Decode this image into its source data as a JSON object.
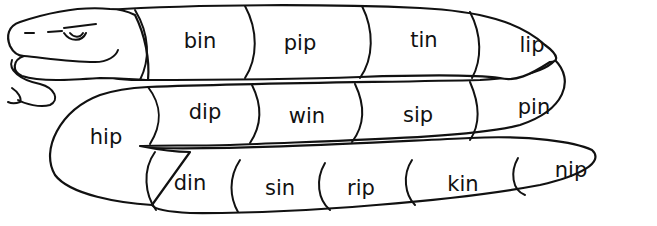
{
  "figure": {
    "stroke_color": "#111111",
    "background_color": "#ffffff",
    "rows": [
      {
        "row": "top",
        "words": [
          "bin",
          "pip",
          "tin",
          "lip"
        ]
      },
      {
        "row": "middle",
        "words": [
          "dip",
          "win",
          "sip",
          "pin"
        ]
      },
      {
        "row": "bend",
        "words": [
          "hip"
        ]
      },
      {
        "row": "bottom",
        "words": [
          "din",
          "sin",
          "rip",
          "kin",
          "nip"
        ]
      }
    ],
    "words": {
      "bin": "bin",
      "pip": "pip",
      "tin": "tin",
      "lip": "lip",
      "dip": "dip",
      "win": "win",
      "sip": "sip",
      "pin": "pin",
      "hip": "hip",
      "din": "din",
      "sin": "sin",
      "rip": "rip",
      "kin": "kin",
      "nip": "nip"
    },
    "icons": {
      "head": "snake-head-icon",
      "eye": "eye-icon",
      "tongue": "tongue-icon"
    }
  }
}
